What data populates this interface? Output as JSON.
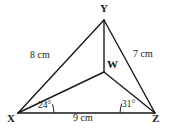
{
  "figure": {
    "type": "geometry-diagram",
    "shape": "triangle-with-interior-point",
    "stroke_color": "#1a1a1a",
    "background_color": "#ffffff"
  },
  "vertices": [
    {
      "id": "Y",
      "label": "Y",
      "x": 104,
      "y": 20
    },
    {
      "id": "X",
      "label": "X",
      "x": 18,
      "y": 113
    },
    {
      "id": "Z",
      "label": "Z",
      "x": 155,
      "y": 113
    },
    {
      "id": "W",
      "label": "W",
      "x": 104,
      "y": 72
    }
  ],
  "segments": [
    {
      "from": "X",
      "to": "Y"
    },
    {
      "from": "Y",
      "to": "Z"
    },
    {
      "from": "X",
      "to": "Z"
    },
    {
      "from": "X",
      "to": "W"
    },
    {
      "from": "W",
      "to": "Z"
    },
    {
      "from": "Y",
      "to": "W"
    }
  ],
  "side_labels": [
    {
      "id": "xy",
      "segment": "XY",
      "text": "8 cm"
    },
    {
      "id": "yz",
      "segment": "YZ",
      "text": "7 cm"
    },
    {
      "id": "xz",
      "segment": "XZ",
      "text": "9 cm"
    }
  ],
  "angle_labels": [
    {
      "id": "ax",
      "at_vertex": "X",
      "text": "24°",
      "value": 24
    },
    {
      "id": "az",
      "at_vertex": "Z",
      "text": "31°",
      "value": 31
    }
  ]
}
